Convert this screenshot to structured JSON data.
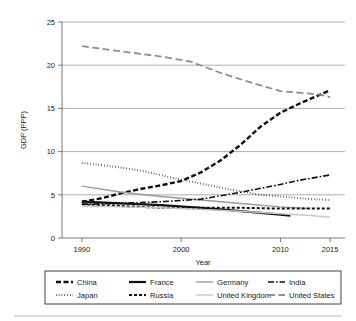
{
  "chart_data": {
    "type": "line",
    "title": "",
    "xlabel": "Year",
    "ylabel": "GDP (PPP)",
    "xlim": [
      1988,
      2016.5
    ],
    "ylim": [
      0,
      25
    ],
    "xticks": [
      1990,
      2000,
      2010,
      2015
    ],
    "xtick_labels": [
      "1990",
      "2000",
      "2010",
      "2015"
    ],
    "yticks": [
      0,
      5,
      10,
      15,
      20,
      25
    ],
    "ytick_labels": [
      "0",
      "5",
      "10",
      "15",
      "20",
      "25"
    ],
    "grid": "horizontal",
    "legend_position": "bottom",
    "legend_columns": 4,
    "legend_rows": 2,
    "series": [
      {
        "name": "China",
        "style": "dashed-thick",
        "color": "#111111",
        "x": [
          1990,
          1992,
          1994,
          1996,
          1998,
          2000,
          2002,
          2004,
          2006,
          2008,
          2010,
          2012,
          2014,
          2015
        ],
        "values": [
          4.2,
          4.6,
          5.2,
          5.7,
          6.1,
          6.6,
          7.6,
          9.0,
          10.8,
          12.9,
          14.5,
          15.6,
          16.6,
          17.1
        ]
      },
      {
        "name": "France",
        "style": "solid-thick",
        "color": "#111111",
        "x": [
          1990,
          1994,
          1998,
          2002,
          2006,
          2010,
          2011
        ],
        "values": [
          4.2,
          4.0,
          3.8,
          3.5,
          3.1,
          2.7,
          2.6
        ]
      },
      {
        "name": "Germany",
        "style": "solid",
        "color": "#9a9a9a",
        "x": [
          1990,
          1994,
          1998,
          2002,
          2006,
          2010,
          2013
        ],
        "values": [
          6.0,
          5.3,
          4.8,
          4.4,
          4.0,
          3.6,
          3.4
        ]
      },
      {
        "name": "India",
        "style": "dash-dot",
        "color": "#111111",
        "x": [
          1990,
          1994,
          1998,
          2002,
          2006,
          2010,
          2012,
          2015
        ],
        "values": [
          3.9,
          4.0,
          4.2,
          4.5,
          5.3,
          6.2,
          6.7,
          7.3
        ]
      },
      {
        "name": "Japan",
        "style": "dotted",
        "color": "#1a1a1a",
        "x": [
          1990,
          1993,
          1996,
          1999,
          2002,
          2005,
          2008,
          2011,
          2013,
          2015
        ],
        "values": [
          8.7,
          8.3,
          7.8,
          7.0,
          6.3,
          5.6,
          5.0,
          4.7,
          4.5,
          4.4
        ]
      },
      {
        "name": "Russia",
        "style": "dashed",
        "color": "#111111",
        "x": [
          1990,
          1994,
          1998,
          2002,
          2006,
          2010,
          2013,
          2015
        ],
        "values": [
          3.9,
          3.7,
          3.5,
          3.5,
          3.5,
          3.4,
          3.4,
          3.4
        ]
      },
      {
        "name": "United Kingdom",
        "style": "solid",
        "color": "#c6c6c6",
        "x": [
          1990,
          1994,
          1998,
          2002,
          2006,
          2010,
          2013,
          2015
        ],
        "values": [
          3.7,
          3.6,
          3.5,
          3.3,
          3.1,
          2.8,
          2.6,
          2.4
        ]
      },
      {
        "name": "United States",
        "style": "long-dashed",
        "color": "#8e8e8e",
        "x": [
          1990,
          1994,
          1998,
          2001,
          2004,
          2007,
          2010,
          2012,
          2014,
          2015
        ],
        "values": [
          22.2,
          21.6,
          21.0,
          20.4,
          19.1,
          18.0,
          17.0,
          16.8,
          16.6,
          16.3
        ]
      }
    ]
  },
  "legend": {
    "entries": [
      {
        "label": "China"
      },
      {
        "label": "France"
      },
      {
        "label": "Germany"
      },
      {
        "label": "India"
      },
      {
        "label": "Japan"
      },
      {
        "label": "Russia"
      },
      {
        "label": "United Kingdom"
      },
      {
        "label": "United States"
      }
    ]
  }
}
